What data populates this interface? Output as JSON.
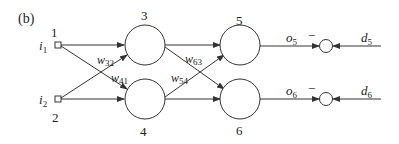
{
  "panel_label": "(b)",
  "inputs": [
    {
      "label_var": "i",
      "label_sub": "1",
      "number": "1"
    },
    {
      "label_var": "i",
      "label_sub": "2",
      "number": "2"
    }
  ],
  "hidden_nodes": [
    {
      "number": "3"
    },
    {
      "number": "4"
    }
  ],
  "output_nodes": [
    {
      "number": "5"
    },
    {
      "number": "6"
    }
  ],
  "weights": [
    {
      "var": "w",
      "sub": "32"
    },
    {
      "var": "w",
      "sub": "41"
    },
    {
      "var": "w",
      "sub": "63"
    },
    {
      "var": "w",
      "sub": "54"
    }
  ],
  "outputs": [
    {
      "var": "o",
      "sub": "5",
      "sign": "−",
      "target_var": "d",
      "target_sub": "5"
    },
    {
      "var": "o",
      "sub": "6",
      "sign": "−",
      "target_var": "d",
      "target_sub": "6"
    }
  ],
  "colors": {
    "stroke": "#333333",
    "background": "#ffffff"
  }
}
